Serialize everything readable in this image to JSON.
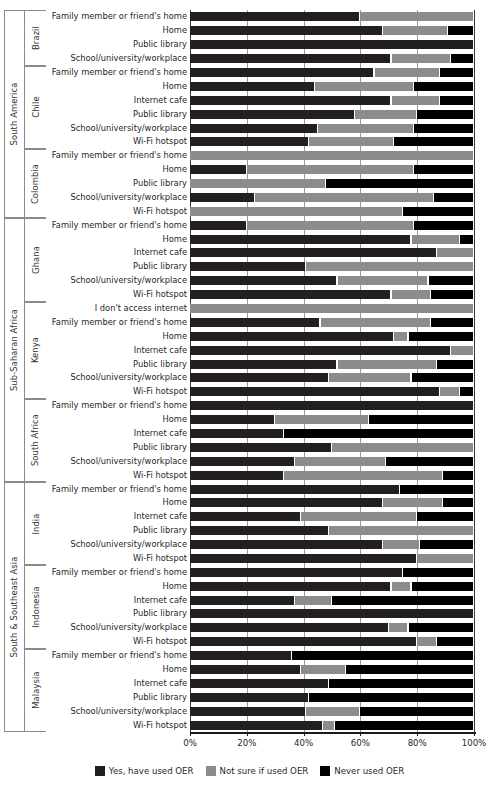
{
  "chart_data": {
    "type": "bar",
    "subtype": "stacked-horizontal-100pct",
    "title": "",
    "xlabel": "",
    "ylabel": "",
    "xlim": [
      0,
      100
    ],
    "xticks": [
      "0%",
      "20%",
      "40%",
      "60%",
      "80%",
      "100%"
    ],
    "xtick_values": [
      0,
      20,
      40,
      60,
      80,
      100
    ],
    "grid": true,
    "legend_position": "bottom-center",
    "series": [
      {
        "name": "Yes, have used OER",
        "color": "#231f20",
        "key": "yes"
      },
      {
        "name": "Not sure if used OER",
        "color": "#8c8c8c",
        "key": "notsure"
      },
      {
        "name": "Never used OER",
        "color": "#000000",
        "key": "never"
      }
    ],
    "regions": [
      {
        "label": "South America",
        "countries": [
          {
            "label": "Brazil",
            "rows": [
              {
                "label": "Family member or friend's home",
                "yes": 60,
                "notsure": 40,
                "never": 0
              },
              {
                "label": "Home",
                "yes": 68,
                "notsure": 23,
                "never": 9
              },
              {
                "label": "Public library",
                "yes": 100,
                "notsure": 0,
                "never": 0
              },
              {
                "label": "School/university/workplace",
                "yes": 71,
                "notsure": 21,
                "never": 8
              }
            ]
          },
          {
            "label": "Chile",
            "rows": [
              {
                "label": "Family member or friend's home",
                "yes": 65,
                "notsure": 23,
                "never": 12
              },
              {
                "label": "Home",
                "yes": 44,
                "notsure": 35,
                "never": 21
              },
              {
                "label": "Internet cafe",
                "yes": 71,
                "notsure": 17,
                "never": 12
              },
              {
                "label": "Public library",
                "yes": 58,
                "notsure": 22,
                "never": 20
              },
              {
                "label": "School/university/workplace",
                "yes": 45,
                "notsure": 34,
                "never": 21
              },
              {
                "label": "Wi-Fi hotspot",
                "yes": 42,
                "notsure": 30,
                "never": 28
              }
            ]
          },
          {
            "label": "Colombia",
            "rows": [
              {
                "label": "Family member or friend's home",
                "yes": 0,
                "notsure": 100,
                "never": 0
              },
              {
                "label": "Home",
                "yes": 20,
                "notsure": 59,
                "never": 21
              },
              {
                "label": "Public library",
                "yes": 0,
                "notsure": 48,
                "never": 52
              },
              {
                "label": "School/university/workplace",
                "yes": 23,
                "notsure": 63,
                "never": 14
              },
              {
                "label": "Wi-Fi hotspot",
                "yes": 0,
                "notsure": 75,
                "never": 25
              }
            ]
          }
        ]
      },
      {
        "label": "Sub-Saharan Africa",
        "countries": [
          {
            "label": "Ghana",
            "rows": [
              {
                "label": "Family member or friend's home",
                "yes": 20,
                "notsure": 59,
                "never": 21
              },
              {
                "label": "Home",
                "yes": 78,
                "notsure": 17,
                "never": 5
              },
              {
                "label": "Internet cafe",
                "yes": 87,
                "notsure": 13,
                "never": 0
              },
              {
                "label": "Public library",
                "yes": 41,
                "notsure": 59,
                "never": 0
              },
              {
                "label": "School/university/workplace",
                "yes": 52,
                "notsure": 32,
                "never": 16
              },
              {
                "label": "Wi-Fi hotspot",
                "yes": 71,
                "notsure": 14,
                "never": 15
              }
            ]
          },
          {
            "label": "Kenya",
            "rows": [
              {
                "label": "I don't access internet",
                "yes": 0,
                "notsure": 100,
                "never": 0
              },
              {
                "label": "Family member or friend's home",
                "yes": 46,
                "notsure": 39,
                "never": 15
              },
              {
                "label": "Home",
                "yes": 72,
                "notsure": 5,
                "never": 23
              },
              {
                "label": "Internet cafe",
                "yes": 92,
                "notsure": 8,
                "never": 0
              },
              {
                "label": "Public library",
                "yes": 52,
                "notsure": 35,
                "never": 13
              },
              {
                "label": "School/university/workplace",
                "yes": 49,
                "notsure": 29,
                "never": 22
              },
              {
                "label": "Wi-Fi hotspot",
                "yes": 88,
                "notsure": 7,
                "never": 5
              }
            ]
          },
          {
            "label": "South Africa",
            "rows": [
              {
                "label": "Family member or friend's home",
                "yes": 100,
                "notsure": 0,
                "never": 0
              },
              {
                "label": "Home",
                "yes": 30,
                "notsure": 33,
                "never": 37
              },
              {
                "label": "Internet cafe",
                "yes": 33,
                "notsure": 0,
                "never": 67
              },
              {
                "label": "Public library",
                "yes": 50,
                "notsure": 50,
                "never": 0
              },
              {
                "label": "School/university/workplace",
                "yes": 37,
                "notsure": 32,
                "never": 31
              },
              {
                "label": "Wi-Fi hotspot",
                "yes": 33,
                "notsure": 56,
                "never": 11
              }
            ]
          }
        ]
      },
      {
        "label": "South & Southeast Asia",
        "countries": [
          {
            "label": "India",
            "rows": [
              {
                "label": "Family member or friend's home",
                "yes": 74,
                "notsure": 0,
                "never": 26
              },
              {
                "label": "Home",
                "yes": 68,
                "notsure": 21,
                "never": 11
              },
              {
                "label": "Internet cafe",
                "yes": 39,
                "notsure": 41,
                "never": 20
              },
              {
                "label": "Public library",
                "yes": 49,
                "notsure": 51,
                "never": 0
              },
              {
                "label": "School/university/workplace",
                "yes": 68,
                "notsure": 13,
                "never": 19
              },
              {
                "label": "Wi-Fi hotspot",
                "yes": 80,
                "notsure": 20,
                "never": 0
              }
            ]
          },
          {
            "label": "Indonesia",
            "rows": [
              {
                "label": "Family member or friend's home",
                "yes": 75,
                "notsure": 0,
                "never": 25
              },
              {
                "label": "Home",
                "yes": 71,
                "notsure": 7,
                "never": 22
              },
              {
                "label": "Internet cafe",
                "yes": 37,
                "notsure": 13,
                "never": 50
              },
              {
                "label": "Public library",
                "yes": 100,
                "notsure": 0,
                "never": 0
              },
              {
                "label": "School/university/workplace",
                "yes": 70,
                "notsure": 7,
                "never": 23
              },
              {
                "label": "Wi-Fi hotspot",
                "yes": 80,
                "notsure": 7,
                "never": 13
              }
            ]
          },
          {
            "label": "Malaysia",
            "rows": [
              {
                "label": "Family member or friend's home",
                "yes": 36,
                "notsure": 0,
                "never": 64
              },
              {
                "label": "Home",
                "yes": 39,
                "notsure": 16,
                "never": 45
              },
              {
                "label": "Internet cafe",
                "yes": 49,
                "notsure": 0,
                "never": 51
              },
              {
                "label": "Public library",
                "yes": 42,
                "notsure": 0,
                "never": 58
              },
              {
                "label": "School/university/workplace",
                "yes": 41,
                "notsure": 19,
                "never": 40
              },
              {
                "label": "Wi-Fi hotspot",
                "yes": 47,
                "notsure": 4,
                "never": 49
              }
            ]
          }
        ]
      }
    ]
  }
}
